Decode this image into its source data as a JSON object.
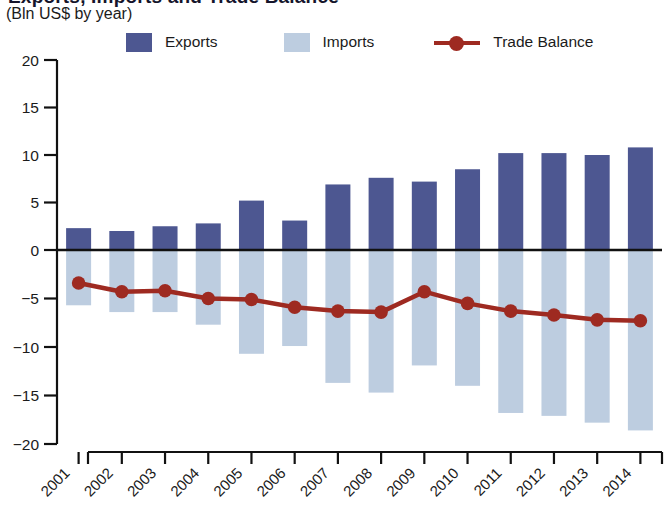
{
  "header": {
    "title_fragment": "Exports, Imports and Trade Balance",
    "subtitle": "(Bln US$ by year)"
  },
  "legend": {
    "items": [
      {
        "label": "Exports",
        "marker": "square-swatch",
        "color": "#4d5791"
      },
      {
        "label": "Imports",
        "marker": "square-swatch",
        "color": "#bdcde0"
      },
      {
        "label": "Trade Balance",
        "marker": "line-with-dot",
        "color": "#9e2a21"
      }
    ]
  },
  "axes": {
    "y_ticks": [
      "20",
      "15",
      "10",
      "5",
      "0",
      "−5",
      "−10",
      "−15",
      "−20"
    ],
    "y_tick_values": [
      20,
      15,
      10,
      5,
      0,
      -5,
      -10,
      -15,
      -20
    ],
    "x_ticks": [
      "2001",
      "2002",
      "2003",
      "2004",
      "2005",
      "2006",
      "2007",
      "2008",
      "2009",
      "2010",
      "2011",
      "2012",
      "2013",
      "2014"
    ]
  },
  "colors": {
    "exports": "#4d5791",
    "imports": "#bdcde0",
    "trade_balance": "#9e2a21",
    "axis": "#111111",
    "text": "#1b1b1b",
    "background": "#ffffff"
  },
  "chart_data": {
    "type": "bar",
    "title": "Exports, Imports and Trade Balance",
    "subtitle": "(Bln US$ by year)",
    "xlabel": "",
    "ylabel": "Bln US$",
    "ylim": [
      -20,
      20
    ],
    "ytick_step": 5,
    "grid": false,
    "legend_position": "top",
    "categories": [
      "2001",
      "2002",
      "2003",
      "2004",
      "2005",
      "2006",
      "2007",
      "2008",
      "2009",
      "2010",
      "2011",
      "2012",
      "2013",
      "2014"
    ],
    "series": [
      {
        "name": "Exports",
        "type": "bar",
        "color": "#4d5791",
        "values": [
          2.3,
          2.0,
          2.5,
          2.8,
          5.2,
          3.1,
          6.9,
          7.6,
          7.2,
          8.5,
          10.2,
          10.2,
          10.0,
          10.8
        ]
      },
      {
        "name": "Imports",
        "type": "bar",
        "color": "#bdcde0",
        "note": "plotted downward as negative values",
        "values": [
          -5.7,
          -6.4,
          -6.4,
          -7.7,
          -10.7,
          -9.9,
          -13.7,
          -14.7,
          -11.9,
          -14.0,
          -16.8,
          -17.1,
          -17.8,
          -18.6
        ]
      },
      {
        "name": "Trade Balance",
        "type": "line",
        "color": "#9e2a21",
        "values": [
          -3.4,
          -4.3,
          -4.2,
          -5.0,
          -5.1,
          -5.9,
          -6.3,
          -6.4,
          -4.3,
          -5.5,
          -6.3,
          -6.7,
          -7.2,
          -7.3
        ]
      }
    ]
  }
}
